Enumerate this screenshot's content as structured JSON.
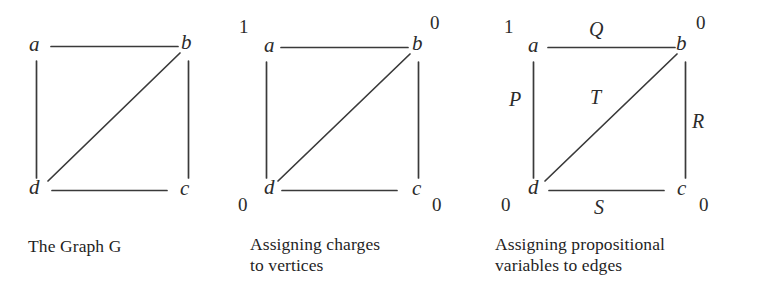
{
  "figure": {
    "background_color": "#ffffff",
    "line_color": "#3a3a3a",
    "text_color": "#2b2b2b"
  },
  "panels": [
    {
      "id": "graph-g",
      "caption": "The Graph G",
      "vertices": [
        {
          "id": "a",
          "label": "a"
        },
        {
          "id": "b",
          "label": "b"
        },
        {
          "id": "c",
          "label": "c"
        },
        {
          "id": "d",
          "label": "d"
        }
      ],
      "edges": [
        {
          "id": "ab",
          "from": "a",
          "to": "b"
        },
        {
          "id": "ad",
          "from": "a",
          "to": "d"
        },
        {
          "id": "bc",
          "from": "b",
          "to": "c"
        },
        {
          "id": "dc",
          "from": "d",
          "to": "c"
        },
        {
          "id": "db",
          "from": "d",
          "to": "b"
        }
      ]
    },
    {
      "id": "charges",
      "caption": "Assigning charges\nto vertices",
      "vertices": [
        {
          "id": "a",
          "label": "a",
          "charge": "1"
        },
        {
          "id": "b",
          "label": "b",
          "charge": "0"
        },
        {
          "id": "c",
          "label": "c",
          "charge": "0"
        },
        {
          "id": "d",
          "label": "d",
          "charge": "0"
        }
      ],
      "edges": [
        {
          "id": "ab",
          "from": "a",
          "to": "b"
        },
        {
          "id": "ad",
          "from": "a",
          "to": "d"
        },
        {
          "id": "bc",
          "from": "b",
          "to": "c"
        },
        {
          "id": "dc",
          "from": "d",
          "to": "c"
        },
        {
          "id": "db",
          "from": "d",
          "to": "b"
        }
      ]
    },
    {
      "id": "propositional-variables",
      "caption": "Assigning propositional\nvariables to edges",
      "vertices": [
        {
          "id": "a",
          "label": "a",
          "charge": "1"
        },
        {
          "id": "b",
          "label": "b",
          "charge": "0"
        },
        {
          "id": "c",
          "label": "c",
          "charge": "0"
        },
        {
          "id": "d",
          "label": "d",
          "charge": "0"
        }
      ],
      "edges": [
        {
          "id": "ab",
          "from": "a",
          "to": "b",
          "variable": "Q"
        },
        {
          "id": "ad",
          "from": "a",
          "to": "d",
          "variable": "P"
        },
        {
          "id": "bc",
          "from": "b",
          "to": "c",
          "variable": "R"
        },
        {
          "id": "dc",
          "from": "d",
          "to": "c",
          "variable": "S"
        },
        {
          "id": "db",
          "from": "d",
          "to": "b",
          "variable": "T"
        }
      ]
    }
  ]
}
